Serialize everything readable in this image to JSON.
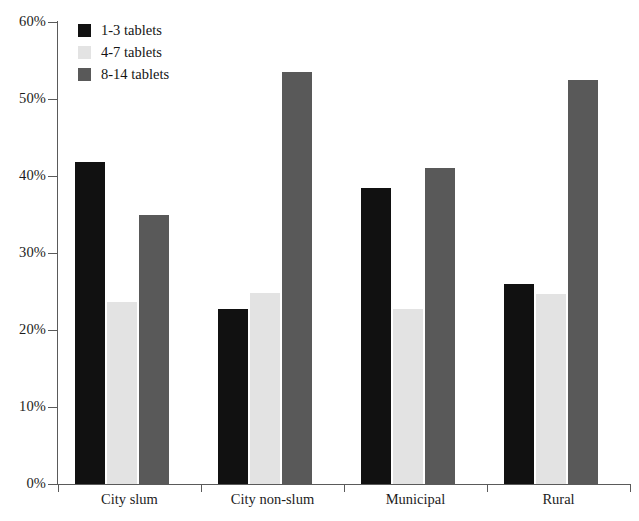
{
  "chart_data": {
    "type": "bar",
    "title": "",
    "subtitle": "",
    "xlabel": "",
    "ylabel": "",
    "categories": [
      "City slum",
      "City non-slum",
      "Municipal",
      "Rural"
    ],
    "series": [
      {
        "name": "1-3 tablets",
        "color": "#111111",
        "values": [
          41.8,
          22.7,
          38.5,
          26.0
        ]
      },
      {
        "name": "4-7 tablets",
        "color": "#e3e3e3",
        "values": [
          23.6,
          24.8,
          22.7,
          24.7
        ]
      },
      {
        "name": "8-14 tablets",
        "color": "#595959",
        "values": [
          35.0,
          53.5,
          41.0,
          52.5
        ]
      }
    ],
    "ylim": [
      0,
      60
    ],
    "ytick_step": 10,
    "ytick_labels": [
      "0%",
      "10%",
      "20%",
      "30%",
      "40%",
      "50%",
      "60%"
    ],
    "ytick_values": [
      0,
      10,
      20,
      30,
      40,
      50,
      60
    ],
    "grid": false,
    "legend_position": "top-left",
    "value_suffix": "%"
  },
  "legend": {
    "items": [
      {
        "label": "1-3 tablets",
        "color": "#111111"
      },
      {
        "label": "4-7 tablets",
        "color": "#e3e3e3"
      },
      {
        "label": "8-14 tablets",
        "color": "#595959"
      }
    ]
  },
  "axis": {
    "y_labels": [
      "60%",
      "50%",
      "40%",
      "30%",
      "20%",
      "10%",
      "0%"
    ],
    "x_labels": [
      "City slum",
      "City non-slum",
      "Municipal",
      "Rural"
    ]
  }
}
